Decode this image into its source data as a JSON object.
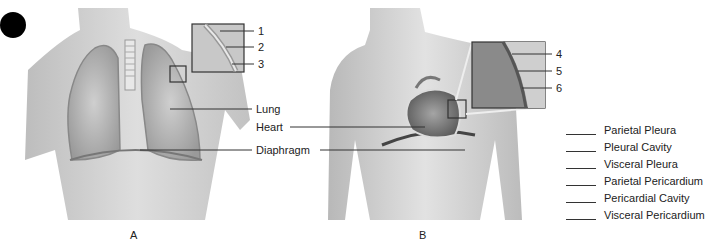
{
  "figure_a": {
    "caption": "A",
    "labels": {
      "lung": "Lung",
      "heart": "Heart",
      "diaphragm": "Diaphragm"
    },
    "inset_numbers": [
      "1",
      "2",
      "3"
    ]
  },
  "figure_b": {
    "caption": "B",
    "inset_numbers": [
      "4",
      "5",
      "6"
    ]
  },
  "answer_key": {
    "items": [
      {
        "blank": "______",
        "term": "Parietal Pleura"
      },
      {
        "blank": "______",
        "term": "Pleural Cavity"
      },
      {
        "blank": "______",
        "term": "Visceral Pleura"
      },
      {
        "blank": "______",
        "term": "Parietal Pericardium"
      },
      {
        "blank": "______",
        "term": "Pericardial Cavity"
      },
      {
        "blank": "______",
        "term": "Visceral Pericardium"
      }
    ]
  },
  "colors": {
    "bullet": "#000000",
    "skin": "#d9d9d9",
    "lung": "#b5b5b5",
    "line": "#333333"
  }
}
